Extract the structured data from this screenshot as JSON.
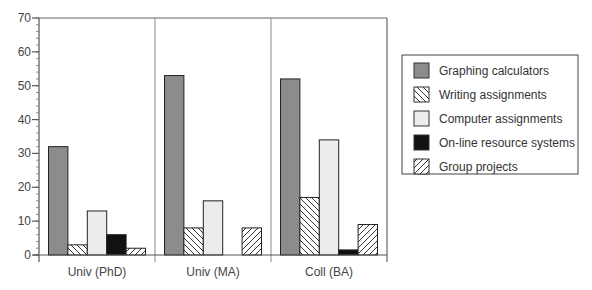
{
  "chart_data": {
    "type": "bar",
    "title": "",
    "xlabel": "",
    "ylabel": "",
    "ylim": [
      0,
      70
    ],
    "yticks": [
      0,
      10,
      20,
      30,
      40,
      50,
      60,
      70
    ],
    "minor_tick_step": 2,
    "grid": false,
    "group_dividers": true,
    "legend_position": "right",
    "categories": [
      "Univ (PhD)",
      "Univ (MA)",
      "Coll (BA)"
    ],
    "series": [
      {
        "name": "Graphing calculators",
        "pattern": "solid",
        "color": "#8c8c8c",
        "values": [
          32,
          53,
          52
        ]
      },
      {
        "name": "Writing assignments",
        "pattern": "hatch-backslash",
        "color": "#ffffff",
        "values": [
          3,
          8,
          17
        ]
      },
      {
        "name": "Computer assignments",
        "pattern": "solid",
        "color": "#ececec",
        "values": [
          13,
          16,
          34
        ]
      },
      {
        "name": "On-line resource systems",
        "pattern": "solid",
        "color": "#111111",
        "values": [
          6,
          0,
          1.5
        ]
      },
      {
        "name": "Group projects",
        "pattern": "hatch-slash",
        "color": "#ffffff",
        "values": [
          2,
          8,
          9
        ]
      }
    ]
  }
}
